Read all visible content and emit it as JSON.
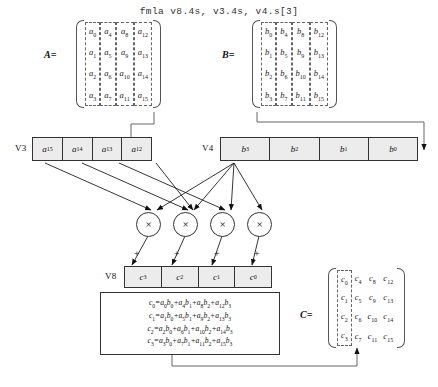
{
  "title": "fmla v8.4s, v3.4s, v4.s[3]",
  "matrix_a": {
    "label": "A=",
    "columns": [
      [
        "a0",
        "a1",
        "a2",
        "a3"
      ],
      [
        "a4",
        "a5",
        "a6",
        "a7"
      ],
      [
        "a8",
        "a9",
        "a10",
        "a11"
      ],
      [
        "a12",
        "a13",
        "a14",
        "a15"
      ]
    ],
    "dashed_columns": [
      0,
      1,
      2,
      3
    ]
  },
  "matrix_b": {
    "label": "B=",
    "columns": [
      [
        "b0",
        "b1",
        "b2",
        "b3"
      ],
      [
        "b4",
        "b5",
        "b6",
        "b7"
      ],
      [
        "b8",
        "b9",
        "b10",
        "b11"
      ],
      [
        "b12",
        "b13",
        "b14",
        "b15"
      ]
    ],
    "dashed_columns": [
      0,
      1,
      2,
      3
    ]
  },
  "matrix_c": {
    "label": "C=",
    "columns": [
      [
        "c0",
        "c1",
        "c2",
        "c3"
      ],
      [
        "c4",
        "c5",
        "c6",
        "c7"
      ],
      [
        "c8",
        "c9",
        "c10",
        "c11"
      ],
      [
        "c12",
        "c13",
        "c14",
        "c15"
      ]
    ],
    "dashed_columns": [
      0
    ]
  },
  "registers": [
    {
      "name": "V3",
      "label": "V3",
      "lanes": [
        "a15",
        "a14",
        "a13",
        "a12"
      ]
    },
    {
      "name": "V4",
      "label": "V4",
      "lanes": [
        "b3",
        "b2",
        "b1",
        "b0"
      ]
    },
    {
      "name": "V8",
      "label": "V8",
      "lanes": [
        "c3",
        "c2",
        "c1",
        "c0"
      ]
    }
  ],
  "multipliers": {
    "symbol": "×",
    "count": 4,
    "accumulate_symbol": "+"
  },
  "formulas": [
    {
      "lhs": "c0",
      "terms": [
        [
          "a0",
          "b0"
        ],
        [
          "a4",
          "b1"
        ],
        [
          "a8",
          "b2"
        ],
        [
          "a12",
          "b3"
        ]
      ]
    },
    {
      "lhs": "c1",
      "terms": [
        [
          "a1",
          "b0"
        ],
        [
          "a5",
          "b1"
        ],
        [
          "a9",
          "b2"
        ],
        [
          "a13",
          "b3"
        ]
      ]
    },
    {
      "lhs": "c2",
      "terms": [
        [
          "a2",
          "b0"
        ],
        [
          "a6",
          "b1"
        ],
        [
          "a10",
          "b2"
        ],
        [
          "a14",
          "b3"
        ]
      ]
    },
    {
      "lhs": "c3",
      "terms": [
        [
          "a3",
          "b0"
        ],
        [
          "a7",
          "b1"
        ],
        [
          "a11",
          "b2"
        ],
        [
          "a15",
          "b3"
        ]
      ]
    }
  ],
  "colors": {
    "stroke": "#333333",
    "bracket": "#555555",
    "dash": "#666666",
    "register_fill": "#ececec",
    "text": "#111111",
    "title": "#333333"
  }
}
